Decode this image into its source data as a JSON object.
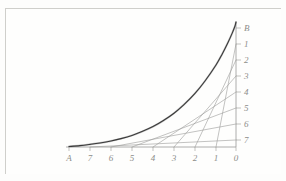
{
  "figure": {
    "background_color": "#fdfdfc",
    "frame_color": "#cfcfcb",
    "curve_color": "#3a3a3a",
    "line_color": "#9a9a98",
    "axis_color": "#9a9a98",
    "label_color": "#8d8d8a"
  },
  "axes": {
    "x_axis": {
      "name": "horizontal-axis",
      "labels": [
        "A",
        "7",
        "6",
        "5",
        "4",
        "3",
        "2",
        "1",
        "0"
      ],
      "origin_label": "0",
      "far_label": "A"
    },
    "y_axis": {
      "name": "vertical-axis",
      "labels": [
        "B",
        "1",
        "2",
        "3",
        "4",
        "5",
        "6",
        "7"
      ],
      "top_label": "B",
      "far_label": "B"
    }
  },
  "chart_data": {
    "type": "line",
    "xlabel": "",
    "ylabel": "",
    "grid": false,
    "legend": null,
    "x_tick_labels": [
      "A",
      "7",
      "6",
      "5",
      "4",
      "3",
      "2",
      "1",
      "0"
    ],
    "y_tick_labels": [
      "B",
      "1",
      "2",
      "3",
      "4",
      "5",
      "6",
      "7"
    ],
    "x_tick_positions_px": [
      69,
      90,
      111,
      132,
      153,
      174,
      195,
      216,
      236
    ],
    "y_tick_positions_px": [
      28,
      44,
      60,
      76,
      92,
      108,
      124,
      140
    ],
    "axis_origin_px": [
      236,
      147
    ],
    "series": [
      {
        "name": "envelope-curve",
        "description": "Smooth concave curve from A on the x-axis rising steeply to B at the top of the y-axis",
        "points_px": [
          [
            69,
            146.5
          ],
          [
            80,
            145.6
          ],
          [
            90,
            144.4
          ],
          [
            100,
            143.0
          ],
          [
            111,
            141.0
          ],
          [
            121,
            138.6
          ],
          [
            132,
            135.4
          ],
          [
            142,
            131.6
          ],
          [
            153,
            126.6
          ],
          [
            163,
            120.8
          ],
          [
            174,
            113.2
          ],
          [
            184,
            104.6
          ],
          [
            195,
            93.4
          ],
          [
            205,
            81.0
          ],
          [
            216,
            65.0
          ],
          [
            222,
            54.4
          ],
          [
            228,
            42.4
          ],
          [
            232,
            33.6
          ],
          [
            235,
            26.0
          ],
          [
            236,
            22.0
          ]
        ]
      }
    ],
    "tangent_lines": [
      {
        "name": "tangent-1",
        "from_x_label": "7",
        "to_y_label": "7",
        "from_px": [
          90,
          147
        ],
        "to_px": [
          236,
          140
        ]
      },
      {
        "name": "tangent-2",
        "from_x_label": "6",
        "to_y_label": "6",
        "from_px": [
          111,
          147
        ],
        "to_px": [
          236,
          124
        ]
      },
      {
        "name": "tangent-3",
        "from_x_label": "5",
        "to_y_label": "5",
        "from_px": [
          132,
          147
        ],
        "to_px": [
          236,
          108
        ]
      },
      {
        "name": "tangent-4",
        "from_x_label": "4",
        "to_y_label": "4",
        "from_px": [
          153,
          147
        ],
        "to_px": [
          236,
          92
        ]
      },
      {
        "name": "tangent-5",
        "from_x_label": "3",
        "to_y_label": "3",
        "from_px": [
          174,
          147
        ],
        "to_px": [
          236,
          76
        ]
      },
      {
        "name": "tangent-6",
        "from_x_label": "2",
        "to_y_label": "2",
        "from_px": [
          195,
          147
        ],
        "to_px": [
          236,
          60
        ]
      },
      {
        "name": "tangent-7",
        "from_x_label": "1",
        "to_y_label": "1",
        "from_px": [
          216,
          147
        ],
        "to_px": [
          236,
          44
        ]
      }
    ]
  }
}
